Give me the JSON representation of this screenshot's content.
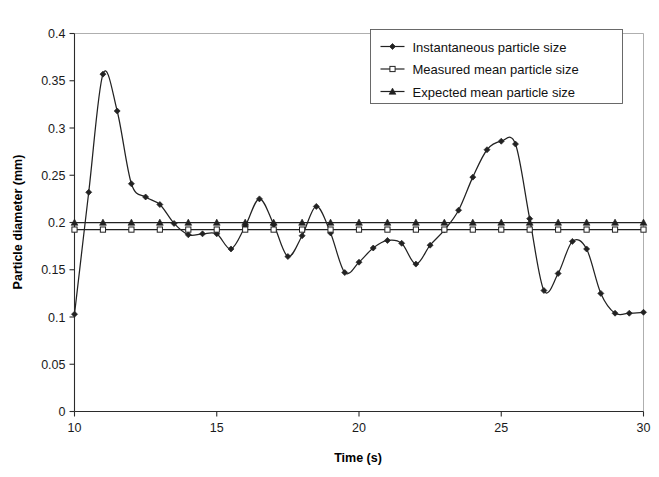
{
  "chart_data": {
    "type": "line",
    "title": "",
    "xlabel": "Time (s)",
    "ylabel": "Particle diameter (mm)",
    "xlim": [
      10,
      30
    ],
    "ylim": [
      0,
      0.4
    ],
    "xticks": [
      10,
      15,
      20,
      25,
      30
    ],
    "xtick_labels": [
      "10",
      "15",
      "20",
      "25",
      "30"
    ],
    "yticks": [
      0,
      0.05,
      0.1,
      0.15,
      0.2,
      0.25,
      0.3,
      0.35,
      0.4
    ],
    "ytick_labels": [
      "0",
      "0.05",
      "0.1",
      "0.15",
      "0.2",
      "0.25",
      "0.3",
      "0.35",
      "0.4"
    ],
    "grid": false,
    "legend_position": "top-right",
    "x": [
      10,
      10.5,
      11,
      11.5,
      12,
      12.5,
      13,
      13.5,
      14,
      14.5,
      15,
      15.5,
      16,
      16.5,
      17,
      17.5,
      18,
      18.5,
      19,
      19.5,
      20,
      20.5,
      21,
      21.5,
      22,
      22.5,
      23,
      23.5,
      24,
      24.5,
      25,
      25.5,
      26,
      26.5,
      27,
      27.5,
      28,
      28.5,
      29,
      29.5,
      30
    ],
    "series": [
      {
        "name": "Instantaneous particle size",
        "marker": "filled-diamond",
        "values": [
          0.103,
          0.232,
          0.357,
          0.318,
          0.241,
          0.227,
          0.219,
          0.199,
          0.187,
          0.188,
          0.188,
          0.172,
          0.196,
          0.225,
          0.198,
          0.164,
          0.186,
          0.217,
          0.189,
          0.147,
          0.158,
          0.173,
          0.181,
          0.178,
          0.156,
          0.176,
          0.192,
          0.213,
          0.248,
          0.277,
          0.286,
          0.283,
          0.204,
          0.128,
          0.146,
          0.18,
          0.172,
          0.125,
          0.104,
          0.104,
          0.105
        ]
      },
      {
        "name": "Measured mean particle size",
        "marker": "open-square",
        "values": [
          0.1925,
          0.1925,
          0.1925,
          0.1925,
          0.1925,
          0.1925,
          0.1925,
          0.1925,
          0.1925,
          0.1925,
          0.1925,
          0.1925,
          0.1925,
          0.1925,
          0.1925,
          0.1925,
          0.1925,
          0.1925,
          0.1925,
          0.1925,
          0.1925,
          0.1925,
          0.1925,
          0.1925,
          0.1925,
          0.1925,
          0.1925,
          0.1925,
          0.1925,
          0.1925,
          0.1925,
          0.1925,
          0.1925,
          0.1925,
          0.1925,
          0.1925,
          0.1925,
          0.1925,
          0.1925,
          0.1925,
          0.1925
        ]
      },
      {
        "name": "Expected mean particle size",
        "marker": "filled-triangle",
        "values": [
          0.2,
          0.2,
          0.2,
          0.2,
          0.2,
          0.2,
          0.2,
          0.2,
          0.2,
          0.2,
          0.2,
          0.2,
          0.2,
          0.2,
          0.2,
          0.2,
          0.2,
          0.2,
          0.2,
          0.2,
          0.2,
          0.2,
          0.2,
          0.2,
          0.2,
          0.2,
          0.2,
          0.2,
          0.2,
          0.2,
          0.2,
          0.2,
          0.2,
          0.2,
          0.2,
          0.2,
          0.2,
          0.2,
          0.2,
          0.2,
          0.2
        ]
      }
    ],
    "marker_every": 2,
    "colors": {
      "line": "#222222",
      "axis": "#2b2b2b",
      "frame": "#9a9a9a",
      "background": "#ffffff"
    }
  },
  "legend": {
    "entries": [
      {
        "label": "Instantaneous particle size",
        "marker": "filled-diamond"
      },
      {
        "label": "Measured mean particle size",
        "marker": "open-square"
      },
      {
        "label": "Expected mean particle size",
        "marker": "filled-triangle"
      }
    ]
  },
  "axes": {
    "x_title": "Time (s)",
    "y_title": "Particle diameter (mm)"
  }
}
